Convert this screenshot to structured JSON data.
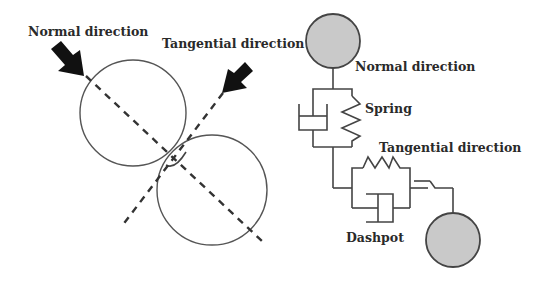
{
  "left_diagram": {
    "title": "Contact of two particles",
    "labels": {
      "normal": "Normal direction",
      "tangential": "Tangential direction"
    },
    "elements": [
      "upper-particle",
      "lower-particle",
      "normal-axis",
      "tangential-axis",
      "normal-arrow",
      "tangential-arrow"
    ]
  },
  "right_diagram": {
    "title": "Spring-dashpot contact model",
    "labels": {
      "normal": "Normal direction",
      "spring": "Spring",
      "tangential": "Tangential direction",
      "dashpot": "Dashpot"
    },
    "colors": {
      "particle_fill": "#c9c9c9",
      "line": "#444444"
    }
  }
}
